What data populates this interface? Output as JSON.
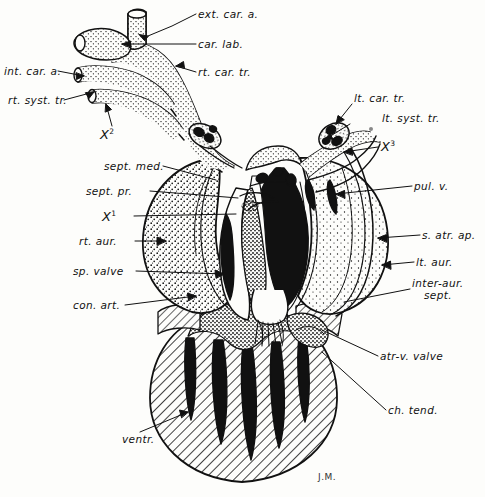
{
  "figure": {
    "signature": "J.M.",
    "ink_color": "#111111",
    "paper_color": "#fdfdfb"
  },
  "labels": {
    "ext_car_a": "ext. car. a.",
    "car_lab": "car. lab.",
    "rt_car_tr": "rt. car. tr.",
    "int_car_a": "int. car. a.",
    "rt_syst_tr": "rt. syst. tr.",
    "x2": "X",
    "x2_sup": "2",
    "sept_med": "sept. med.",
    "sept_pr": "sept. pr.",
    "x1": "X",
    "x1_sup": "1",
    "rt_aur": "rt. aur.",
    "sp_valve": "sp. valve",
    "con_art": "con. art.",
    "ventr": "ventr.",
    "lt_car_tr": "lt. car. tr.",
    "lt_syst_tr": "lt. syst. tr.",
    "x3": "X",
    "x3_sup": "3",
    "pul_v": "pul. v.",
    "s_atr_ap": "s. atr. ap.",
    "lt_aur": "lt. aur.",
    "inter_aur_sept_line1": "inter-aur.",
    "inter_aur_sept_line2": "sept.",
    "atr_v_valve": "atr-v. valve",
    "ch_tend": "ch. tend."
  }
}
